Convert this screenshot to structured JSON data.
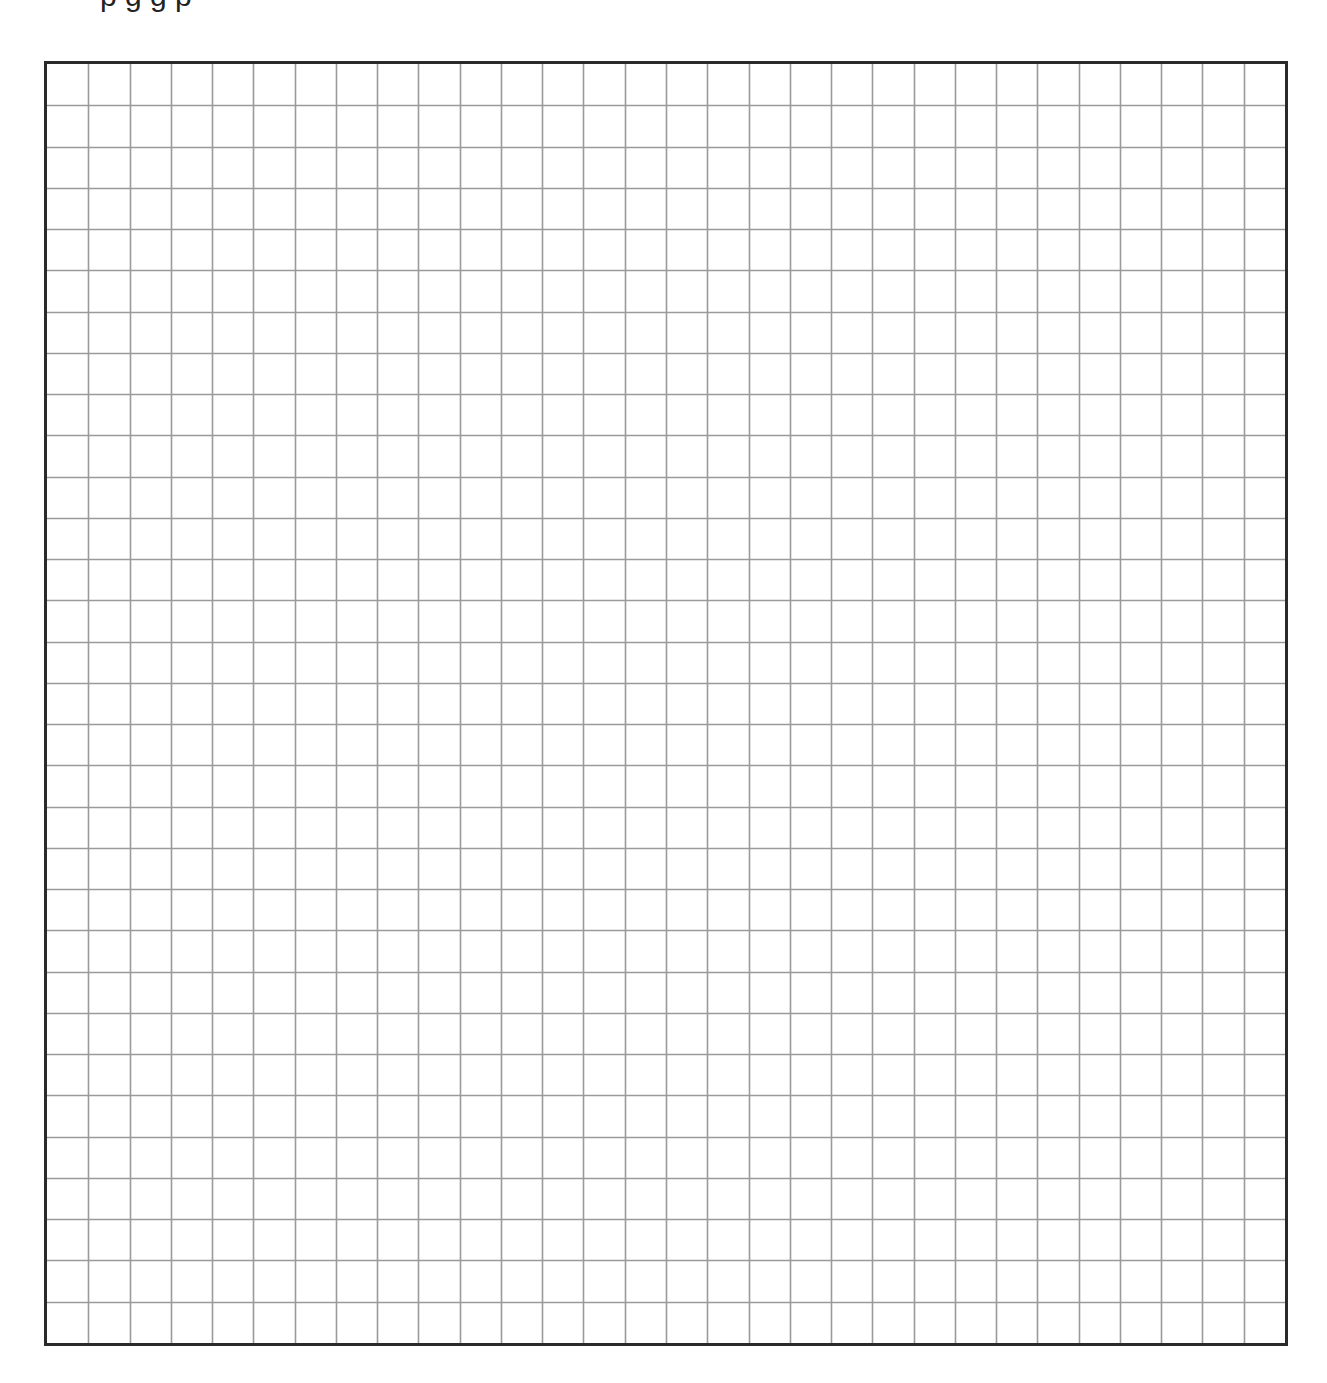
{
  "page": {
    "heading_clipped_text": "p g g p",
    "heading_visible": "descenders only (text cut off at top edge)"
  },
  "grid": {
    "columns": 30,
    "rows": 31,
    "cell_width_px": 41.5,
    "cell_height_px": 41.5,
    "border_color": "#2a2a2a",
    "line_color": "#9a9a9a",
    "background_color": "#ffffff",
    "description": "Blank square graph-paper grid"
  }
}
